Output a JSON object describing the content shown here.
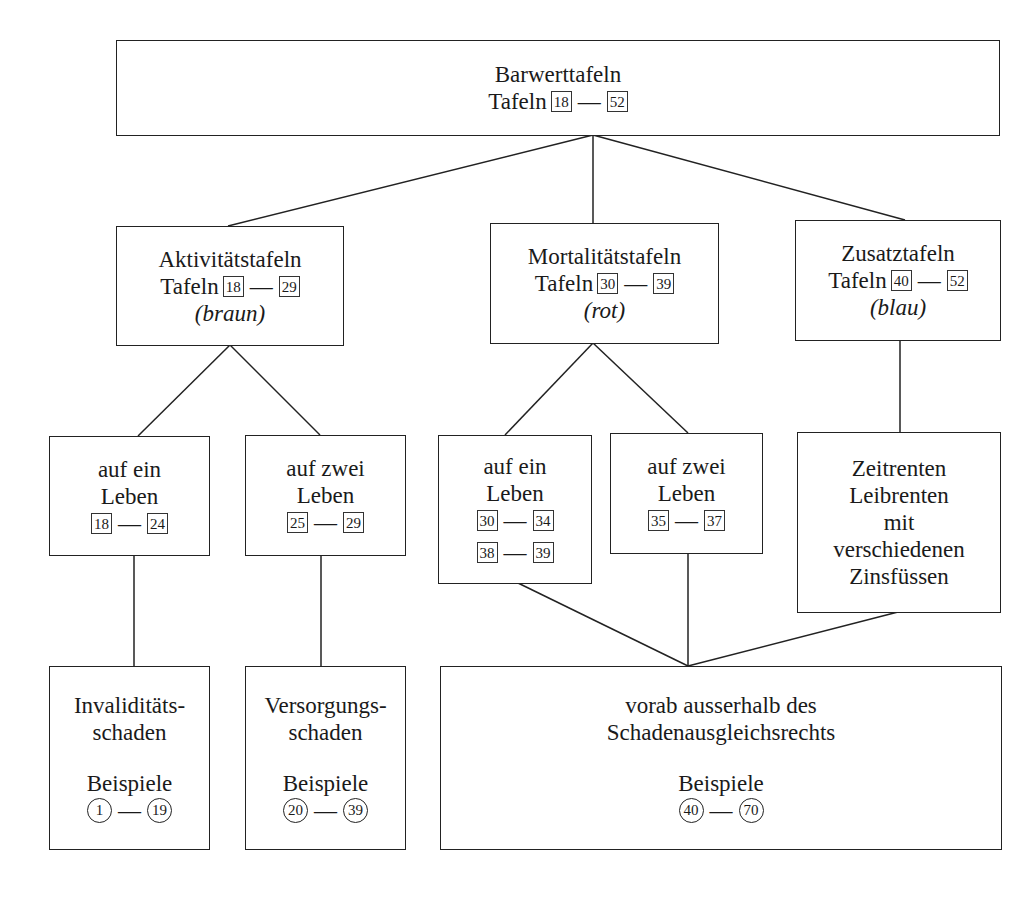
{
  "diagram": {
    "root": {
      "title": "Barwerttafeln",
      "label": "Tafeln",
      "range": [
        "18",
        "52"
      ]
    },
    "categories": [
      {
        "title": "Aktivitätstafeln",
        "label": "Tafeln",
        "range": [
          "18",
          "29"
        ],
        "color_note": "(braun)",
        "children": [
          {
            "lines": [
              "auf ein",
              "Leben"
            ],
            "ranges": [
              [
                "18",
                "24"
              ]
            ]
          },
          {
            "lines": [
              "auf zwei",
              "Leben"
            ],
            "ranges": [
              [
                "25",
                "29"
              ]
            ]
          }
        ]
      },
      {
        "title": "Mortalitätstafeln",
        "label": "Tafeln",
        "range": [
          "30",
          "39"
        ],
        "color_note": "(rot)",
        "children": [
          {
            "lines": [
              "auf ein",
              "Leben"
            ],
            "ranges": [
              [
                "30",
                "34"
              ],
              [
                "38",
                "39"
              ]
            ]
          },
          {
            "lines": [
              "auf zwei",
              "Leben"
            ],
            "ranges": [
              [
                "35",
                "37"
              ]
            ]
          }
        ]
      },
      {
        "title": "Zusatztafeln",
        "label": "Tafeln",
        "range": [
          "40",
          "52"
        ],
        "color_note": "(blau)",
        "children": [
          {
            "lines": [
              "Zeitrenten",
              "Leibrenten",
              "mit",
              "verschiedenen",
              "Zinsfüssen"
            ]
          }
        ]
      }
    ],
    "outcomes": [
      {
        "lines": [
          "Invaliditäts-",
          "schaden"
        ],
        "examples_label": "Beispiele",
        "examples": [
          "1",
          "19"
        ]
      },
      {
        "lines": [
          "Versorgungs-",
          "schaden"
        ],
        "examples_label": "Beispiele",
        "examples": [
          "20",
          "39"
        ]
      },
      {
        "lines": [
          "vorab ausserhalb des",
          "Schadenausgleichsrechts"
        ],
        "examples_label": "Beispiele",
        "examples": [
          "40",
          "70"
        ]
      }
    ],
    "dash": "—"
  }
}
